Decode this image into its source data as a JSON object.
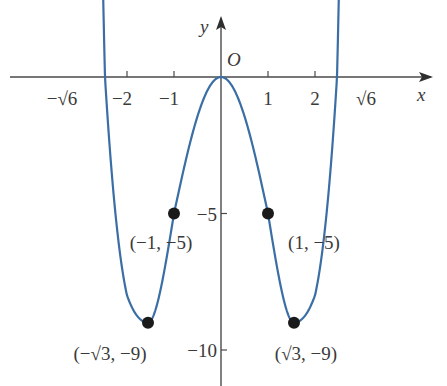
{
  "chart_data": {
    "type": "line",
    "title": "",
    "function": "y = x^4 - 6x^2",
    "xlabel": "x",
    "ylabel": "y",
    "origin_label": "O",
    "xlim": [
      -2.8,
      4.5
    ],
    "ylim": [
      -11.2,
      2.1
    ],
    "grid": false,
    "x_ticks": [
      {
        "value": -2,
        "label": "−2"
      },
      {
        "value": -1,
        "label": "−1"
      },
      {
        "value": 1,
        "label": "1"
      },
      {
        "value": 2,
        "label": "2"
      }
    ],
    "x_special_labels": [
      {
        "value": -2.449,
        "label": "−√6"
      },
      {
        "value": 2.449,
        "label": "√6"
      }
    ],
    "y_ticks": [
      {
        "value": -5,
        "label": "−5"
      },
      {
        "value": -10,
        "label": "−10"
      }
    ],
    "points": [
      {
        "x": -1.732,
        "y": -9,
        "label": "(−√3, −9)"
      },
      {
        "x": -1,
        "y": -5,
        "label": "(−1, −5)"
      },
      {
        "x": 1,
        "y": -5,
        "label": "(1, −5)"
      },
      {
        "x": 1.732,
        "y": -9,
        "label": "(√3, −9)"
      }
    ],
    "curve_color": "#3a6ea5",
    "point_color": "#1a1a1a",
    "axis_color": "#4a4a4a"
  }
}
